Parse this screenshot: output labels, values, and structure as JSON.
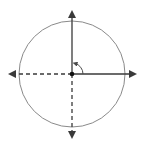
{
  "diagram": {
    "title": "",
    "type": "unit-circle-with-axes",
    "colors": {
      "background": "#ffffff",
      "circle": "#8a8a8a",
      "axis": "#3a3a3a",
      "origin": "#111111",
      "angle_arc": "#4a4a4a"
    },
    "circle": {
      "cx": 72,
      "cy": 74,
      "r": 53
    },
    "axes": {
      "positive_x": {
        "style": "solid",
        "arrow": "right"
      },
      "negative_x": {
        "style": "dashed",
        "arrow": "left"
      },
      "positive_y": {
        "style": "solid",
        "arrow": "up"
      },
      "negative_y": {
        "style": "dashed",
        "arrow": "down"
      }
    },
    "angle_marker": {
      "from": "positive_x",
      "to": "positive_y",
      "label": ""
    },
    "origin_point": {
      "x": 72,
      "y": 74
    }
  }
}
